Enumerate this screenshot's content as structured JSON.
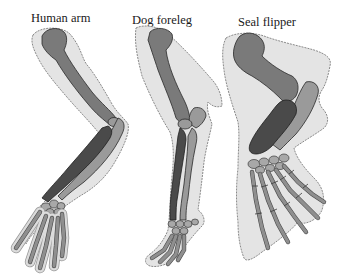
{
  "figure": {
    "panels": [
      {
        "id": "human",
        "label": "Human arm"
      },
      {
        "id": "dog",
        "label": "Dog foreleg"
      },
      {
        "id": "seal",
        "label": "Seal flipper"
      }
    ],
    "colors": {
      "background": "#ffffff",
      "soft_tissue": "#e4e4e4",
      "soft_tissue_outline": "#8a8a8a",
      "humerus": "#7a7a7a",
      "radius": "#9a9a9a",
      "ulna": "#4a4a4a",
      "hand_bones": "#a8a8a8",
      "bone_outline": "#2a2a2a"
    }
  }
}
